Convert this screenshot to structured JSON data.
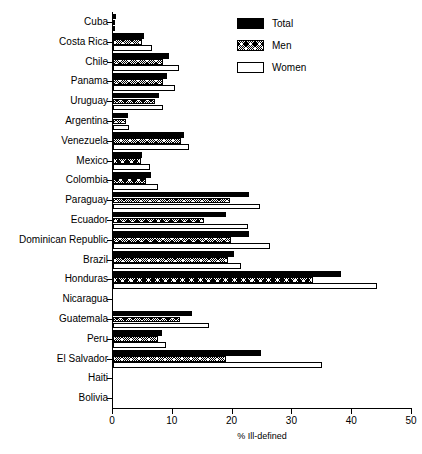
{
  "chart_data": {
    "type": "bar",
    "orientation": "horizontal",
    "title": "",
    "xlabel": "% Ill-defined",
    "ylabel": "",
    "xlim": [
      0,
      50
    ],
    "xticks": [
      0,
      10,
      20,
      30,
      40,
      50
    ],
    "xtick_labels": [
      "0",
      "10",
      "20",
      "30",
      "40",
      "50"
    ],
    "grid": false,
    "legend_position": "top-right",
    "categories": [
      "Cuba",
      "Costa Rica",
      "Chile",
      "Panama",
      "Uruguay",
      "Argentina",
      "Venezuela",
      "Mexico",
      "Colombia",
      "Paraguay",
      "Ecuador",
      "Dominican Republic",
      "Brazil",
      "Honduras",
      "Nicaragua",
      "Guatemala",
      "Peru",
      "El Salvador",
      "Haiti",
      "Bolivia"
    ],
    "series": [
      {
        "name": "Total",
        "style": "solid-black",
        "color": "#000000",
        "values": [
          0.5,
          5.2,
          9.3,
          9.1,
          7.7,
          2.5,
          11.8,
          4.9,
          6.4,
          22.7,
          18.9,
          22.8,
          20.2,
          38.2,
          0.0,
          13.2,
          8.2,
          24.8,
          0.0,
          0.0
        ]
      },
      {
        "name": "Men",
        "style": "hatched",
        "color": "#000000",
        "values": [
          0.4,
          4.8,
          8.4,
          8.4,
          7.0,
          2.2,
          11.3,
          4.7,
          5.6,
          19.5,
          15.3,
          19.7,
          19.3,
          33.5,
          0.0,
          11.2,
          7.6,
          18.9,
          0.0,
          0.0
        ]
      },
      {
        "name": "Women",
        "style": "white-outline",
        "color": "#ffffff",
        "values": [
          0.3,
          6.6,
          11.0,
          10.4,
          8.3,
          2.7,
          12.7,
          6.2,
          7.6,
          24.5,
          22.6,
          26.3,
          21.4,
          44.2,
          0.0,
          16.0,
          8.9,
          34.9,
          0.0,
          0.0
        ]
      }
    ]
  },
  "legend": {
    "items": [
      {
        "label": "Total",
        "swatch": "solid-black"
      },
      {
        "label": "Men",
        "swatch": "hatched"
      },
      {
        "label": "Women",
        "swatch": "white-outline"
      }
    ]
  },
  "axis": {
    "x_title": "% Ill-defined"
  }
}
